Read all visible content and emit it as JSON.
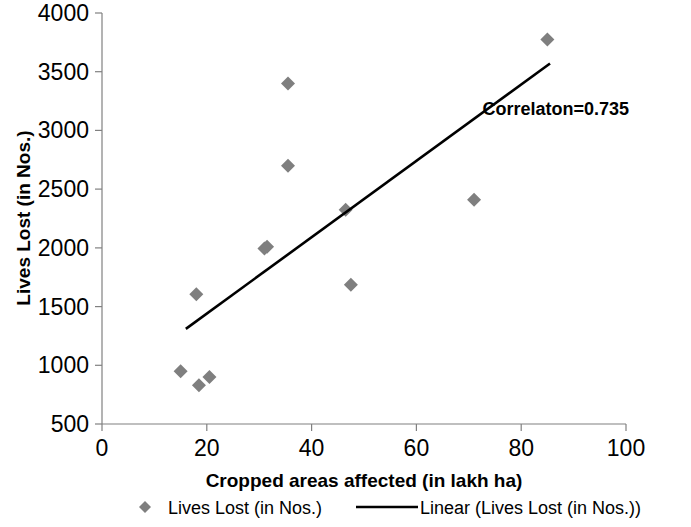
{
  "chart_data": {
    "type": "scatter",
    "title": "",
    "xlabel": "Cropped areas affected (in lakh ha)",
    "ylabel": "Lives Lost (in Nos.)",
    "xlim": [
      0,
      100
    ],
    "ylim": [
      500,
      4000
    ],
    "xticks": [
      0,
      20,
      40,
      60,
      80,
      100
    ],
    "xtick_labels": [
      "0",
      "20",
      "40",
      "60",
      "80",
      "100"
    ],
    "yticks": [
      500,
      1000,
      1500,
      2000,
      2500,
      3000,
      3500,
      4000
    ],
    "ytick_labels": [
      "500",
      "1000",
      "1500",
      "2000",
      "2500",
      "3000",
      "3500",
      "4000"
    ],
    "grid": false,
    "legend_position": "bottom",
    "annotations": [
      {
        "text": "Correlaton=0.735",
        "x": 81,
        "y": 3180
      }
    ],
    "series": [
      {
        "name": "Lives Lost (in Nos.)",
        "type": "scatter",
        "marker": "diamond",
        "color": "#7f7f7f",
        "points": [
          {
            "x": 15,
            "y": 950
          },
          {
            "x": 18.5,
            "y": 830
          },
          {
            "x": 20.5,
            "y": 900
          },
          {
            "x": 18,
            "y": 1605
          },
          {
            "x": 31,
            "y": 1995
          },
          {
            "x": 31.5,
            "y": 2010
          },
          {
            "x": 35.5,
            "y": 3400
          },
          {
            "x": 35.5,
            "y": 2700
          },
          {
            "x": 46.5,
            "y": 2325
          },
          {
            "x": 47.5,
            "y": 1685
          },
          {
            "x": 71,
            "y": 2410
          },
          {
            "x": 85,
            "y": 3775
          }
        ]
      },
      {
        "name": "Linear (Lives Lost (in Nos.))",
        "type": "line",
        "color": "#000000",
        "endpoints": [
          {
            "x": 16,
            "y": 1310
          },
          {
            "x": 85.5,
            "y": 3570
          }
        ]
      }
    ],
    "legend_entries": [
      {
        "label": "Lives Lost (in Nos.)",
        "marker": "diamond",
        "color": "#7f7f7f"
      },
      {
        "label": "Linear (Lives Lost (in Nos.))",
        "marker": "line",
        "color": "#000000"
      }
    ]
  },
  "colors": {
    "marker": "#7f7f7f",
    "trendline": "#000000",
    "axis": "#808080",
    "text": "#000000",
    "background": "#ffffff"
  }
}
